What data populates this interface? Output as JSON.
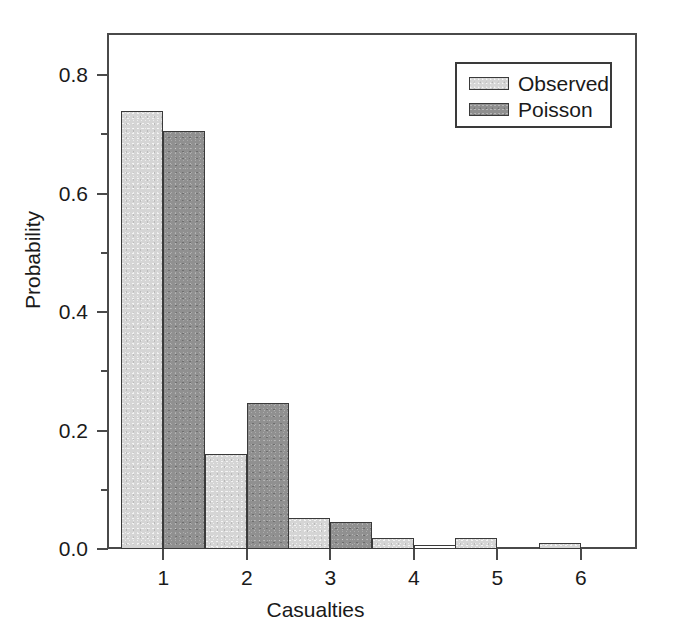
{
  "chart_data": {
    "type": "bar",
    "title": "",
    "subtitle": "",
    "xlabel": "Casualties",
    "ylabel": "Probability",
    "categories": [
      "1",
      "2",
      "3",
      "4",
      "5",
      "6"
    ],
    "series": [
      {
        "name": "Observed",
        "color": "#d5d5d5",
        "values": [
          0.74,
          0.16,
          0.052,
          0.019,
          0.018,
          0.011
        ]
      },
      {
        "name": "Poisson",
        "color": "#909090",
        "values": [
          0.706,
          0.247,
          0.045,
          0.006,
          0.0,
          0.0
        ]
      }
    ],
    "xlim": [
      0.35,
      6.65
    ],
    "ylim": [
      0.0,
      0.868
    ],
    "yticks": [
      0.0,
      0.2,
      0.4,
      0.6,
      0.8
    ],
    "ytick_labels": [
      "0.0",
      "0.2",
      "0.4",
      "0.6",
      "0.8"
    ],
    "yminor_ticks": [
      0.1,
      0.3,
      0.5,
      0.7
    ],
    "xticks": [
      1,
      2,
      3,
      4,
      5,
      6
    ],
    "xtick_labels": [
      "1",
      "2",
      "3",
      "4",
      "5",
      "6"
    ],
    "grid": false,
    "legend": {
      "position": "top-right",
      "entries": [
        "Observed",
        "Poisson"
      ]
    },
    "frame": {
      "border_color": "#4a4a4a",
      "bar_edge_color": "#3a3a3a"
    }
  }
}
